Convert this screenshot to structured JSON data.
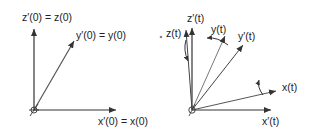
{
  "diagram": {
    "type": "coordinate-frames",
    "panels": [
      {
        "id": "initial",
        "labels": {
          "z": "z′(0) = z(0)",
          "y": "y′(0) = y(0)",
          "x": "x′(0) = x(0)"
        }
      },
      {
        "id": "rotated",
        "labels": {
          "z_prime": "z′(t)",
          "z": "z(t)",
          "y": "y(t)",
          "y_prime": "y′(t)",
          "x": "x(t)",
          "x_prime": "x′(t)"
        }
      }
    ],
    "colors": {
      "axis": "#333333",
      "light_axis": "#777777",
      "text": "#222222"
    }
  }
}
